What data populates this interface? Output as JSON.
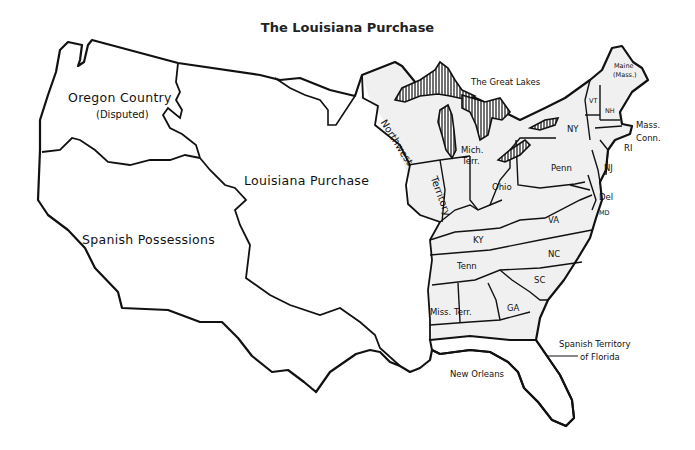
{
  "title": "The Louisiana Purchase",
  "colors": {
    "line": "#111111",
    "background": "#ffffff",
    "us_states_fill": "#f0f0f0",
    "territory_fill": "#ffffff",
    "lakes_hatch": "#111111"
  },
  "regions": {
    "oregon_country": {
      "line1": "Oregon Country",
      "line2": "(Disputed)"
    },
    "louisiana_purchase": "Louisiana Purchase",
    "spanish_possessions": "Spanish Possessions",
    "northwest_territory": {
      "part1": "Northwest",
      "part2": "Territory"
    },
    "great_lakes": "The Great Lakes",
    "mich_terr": {
      "line1": "Mich.",
      "line2": "Terr."
    },
    "miss_terr": "Miss. Terr.",
    "spanish_florida": {
      "line1": "Spanish Territory",
      "line2": "of Florida"
    },
    "new_orleans": "New Orleans"
  },
  "states": {
    "maine": {
      "line1": "Maine",
      "line2": "(Mass.)"
    },
    "vt": "VT",
    "nh": "NH",
    "mass": "Mass.",
    "conn": "Conn.",
    "ri": "RI",
    "ny": "NY",
    "nj": "NJ",
    "penn": "Penn",
    "del": "Del",
    "md": "MD",
    "ohio": "Ohio",
    "va": "VA",
    "ky": "KY",
    "nc": "NC",
    "tenn": "Tenn",
    "sc": "SC",
    "ga": "GA"
  }
}
